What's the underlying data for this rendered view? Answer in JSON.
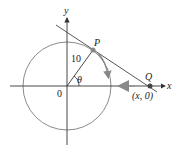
{
  "diagram": {
    "axes": {
      "x_label": "x",
      "y_label": "y",
      "origin_label": "0"
    },
    "circle": {
      "radius_label": "10",
      "stroke_color": "#8a8a8a"
    },
    "points": {
      "P": {
        "label": "P"
      },
      "Q": {
        "label": "Q",
        "coord_label": "(x, 0)"
      }
    },
    "angle": {
      "label": "θ"
    },
    "colors": {
      "axis": "#333333",
      "tangent_line": "#444444",
      "motion_arrow": "#8a8a8a",
      "point": "#555555"
    }
  }
}
